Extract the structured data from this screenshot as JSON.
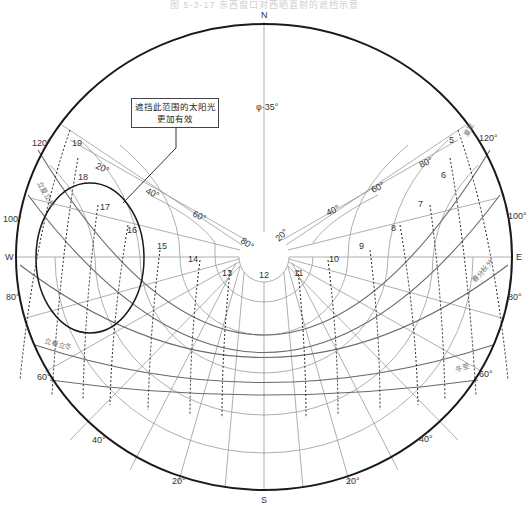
{
  "title": "图 5-3-17  东西窗口对西晒直射的遮挡示意",
  "directions": {
    "north": "N",
    "south": "S",
    "east": "E",
    "west": "W"
  },
  "latitude_label": "φ·35°",
  "callout": {
    "line1": "遮挡此范围的太阳光",
    "line2": "更加有效"
  },
  "altitude_labels": [
    "20°",
    "40°",
    "60°",
    "80°"
  ],
  "azimuth_labels": {
    "left": [
      "120°",
      "100°",
      "80°",
      "60°",
      "40°",
      "20°"
    ],
    "right": [
      "120°",
      "100°",
      "80°",
      "60°",
      "40°",
      "20°"
    ]
  },
  "hour_labels": [
    "5",
    "6",
    "7",
    "8",
    "9",
    "10",
    "11",
    "12",
    "13",
    "14",
    "15",
    "16",
    "17",
    "18",
    "19"
  ],
  "curve_labels": {
    "summer_solstice": "夏至",
    "spring_autumn_equinox": "春分秋分",
    "winter_solstice": "冬至",
    "start_summer_autumn": "立夏立秋",
    "start_spring_winter": "立春立冬"
  },
  "colors": {
    "outline": "#1a1a1a",
    "grid": "#8a8a8a",
    "curve": "#6a6a6a",
    "text": "#333333"
  }
}
